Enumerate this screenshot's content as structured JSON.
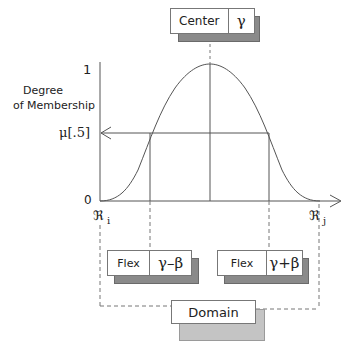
{
  "center_box": {
    "label": "Center",
    "symbol": "γ"
  },
  "axis": {
    "y_label_line1": "Degree",
    "y_label_line2": "of Membership",
    "y_top": "1",
    "y_half": "μ[.5]",
    "y_zero": "0",
    "x_left": "ℜ",
    "x_left_sub": "i",
    "x_right": "ℜ",
    "x_right_sub": "j"
  },
  "flex_left": {
    "label": "Flex",
    "symbol": "γ–β"
  },
  "flex_right": {
    "label": "Flex",
    "symbol": "γ+β"
  },
  "domain_box": {
    "label": "Domain"
  },
  "colors": {
    "line": "#555555",
    "shadow_dark": "#8a8a8a",
    "shadow_light": "#c4c4c4"
  }
}
